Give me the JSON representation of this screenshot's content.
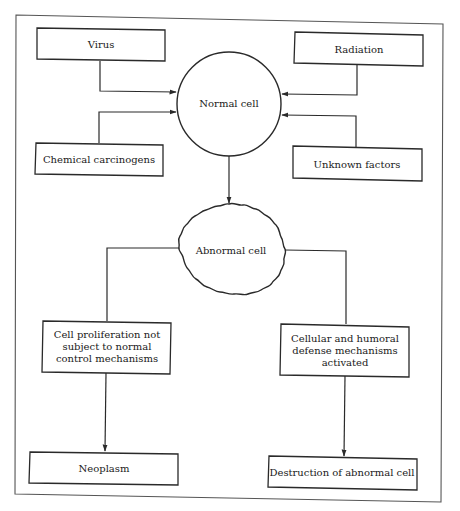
{
  "diagram": {
    "title": "",
    "nodes": {
      "virus": {
        "label": "Virus"
      },
      "radiation": {
        "label": "Radiation"
      },
      "normal_cell": {
        "label": "Normal cell"
      },
      "chemical": {
        "label": "Chemical carcinogens"
      },
      "unknown": {
        "label": "Unknown factors"
      },
      "abnormal_cell": {
        "label": "Abnormal cell"
      },
      "proliferation": {
        "lines": [
          "Cell proliferation not",
          "subject to normal",
          "control mechanisms"
        ]
      },
      "defense": {
        "lines": [
          "Cellular and humoral",
          "defense mechanisms",
          "activated"
        ]
      },
      "neoplasm": {
        "label": "Neoplasm"
      },
      "destruction": {
        "label": "Destruction of abnormal cell"
      }
    },
    "edges": [
      {
        "from": "Virus",
        "to": "Normal cell"
      },
      {
        "from": "Chemical carcinogens",
        "to": "Normal cell"
      },
      {
        "from": "Radiation",
        "to": "Normal cell"
      },
      {
        "from": "Unknown factors",
        "to": "Normal cell"
      },
      {
        "from": "Normal cell",
        "to": "Abnormal cell"
      },
      {
        "from": "Abnormal cell",
        "to": "Cell proliferation not subject to normal control mechanisms"
      },
      {
        "from": "Abnormal cell",
        "to": "Cellular and humoral defense mechanisms activated"
      },
      {
        "from": "Cell proliferation not subject to normal control mechanisms",
        "to": "Neoplasm"
      },
      {
        "from": "Cellular and humoral defense mechanisms activated",
        "to": "Destruction of abnormal cell"
      }
    ],
    "colors": {
      "line": "#2a2a2a",
      "frame": "#555555",
      "background": "#ffffff"
    }
  }
}
